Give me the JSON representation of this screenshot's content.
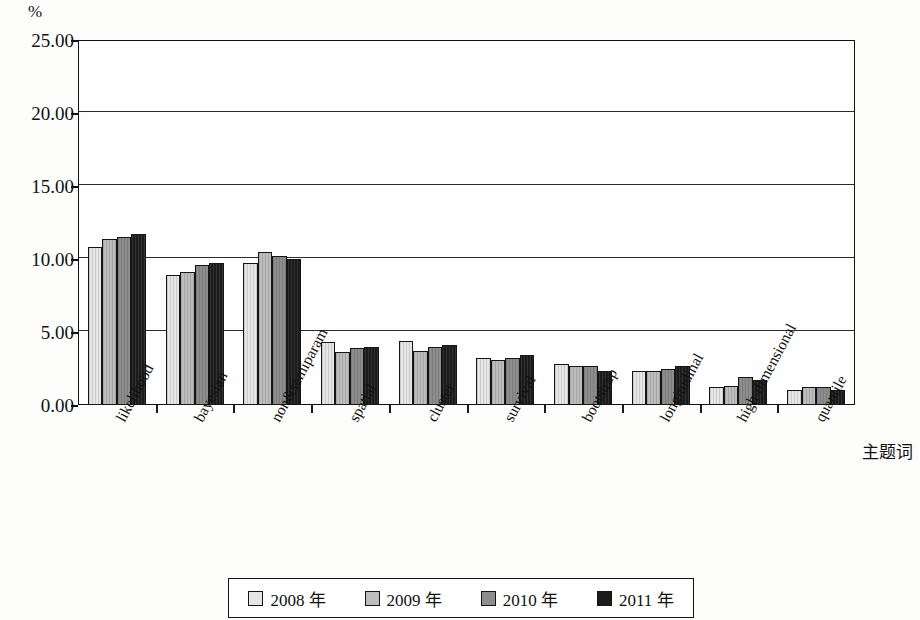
{
  "axis": {
    "unit_label": "%",
    "y_ticks": [
      "0.00",
      "5.00",
      "10.00",
      "15.00",
      "20.00",
      "25.00"
    ],
    "x_axis_title": "主题词"
  },
  "legend": {
    "items": [
      {
        "label": "2008 年",
        "color": "#e6e6e6"
      },
      {
        "label": "2009 年",
        "color": "#bdbdbd"
      },
      {
        "label": "2010 年",
        "color": "#8d8d8d"
      },
      {
        "label": "2011 年",
        "color": "#1b1b1b"
      }
    ]
  },
  "chart_data": {
    "type": "bar",
    "title": "",
    "xlabel": "主题词",
    "ylabel": "%",
    "ylim": [
      0,
      25
    ],
    "yticks": [
      0,
      5,
      10,
      15,
      20,
      25
    ],
    "grid": true,
    "legend_position": "bottom",
    "categories": [
      "likelihood",
      "bayesian",
      "non&semiparam",
      "spatial",
      "cluster",
      "survival",
      "bootstrap",
      "longitudinal",
      "high-dimensional",
      "quantile"
    ],
    "series": [
      {
        "name": "2008 年",
        "color": "#e6e6e6",
        "values": [
          10.8,
          8.9,
          9.7,
          4.3,
          4.4,
          3.2,
          2.8,
          2.3,
          1.2,
          1.0
        ]
      },
      {
        "name": "2009 年",
        "color": "#bdbdbd",
        "values": [
          11.4,
          9.1,
          10.5,
          3.6,
          3.7,
          3.1,
          2.7,
          2.3,
          1.3,
          1.2
        ]
      },
      {
        "name": "2010 年",
        "color": "#8d8d8d",
        "values": [
          11.5,
          9.6,
          10.2,
          3.9,
          4.0,
          3.2,
          2.7,
          2.5,
          1.9,
          1.2
        ]
      },
      {
        "name": "2011 年",
        "color": "#1b1b1b",
        "values": [
          11.7,
          9.7,
          10.0,
          4.0,
          4.1,
          3.4,
          2.3,
          2.7,
          1.7,
          1.0
        ]
      }
    ]
  }
}
